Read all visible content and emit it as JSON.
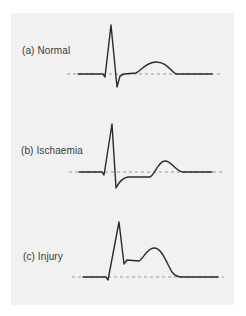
{
  "figure": {
    "background_color": "#f1f1f1",
    "trace_color": "#2a2a2a",
    "baseline_color": "#9a9a9a",
    "panels": [
      {
        "id": "a",
        "label": "(a) Normal",
        "label_pos": {
          "x": 22,
          "y": 45
        },
        "baseline": {
          "x1": 67,
          "x2": 220,
          "y": 74
        },
        "trace_path": "M78,74 L103,74 L105,77 L111,25 L117,87 L120,76 L124,74 L136,73 C142,70 146,62 156,62 C166,62 170,70 176,74 L212,74"
      },
      {
        "id": "b",
        "label": "(b) Ischaemia",
        "label_pos": {
          "x": 21,
          "y": 145
        },
        "baseline": {
          "x1": 69,
          "x2": 222,
          "y": 172
        },
        "trace_path": "M79,172 L102,172 L104,175 L112,124 L116,188 C119,182 122,178 128,177 L150,177 C155,175 158,161 165,161 C172,161 176,172 183,172 L212,172"
      },
      {
        "id": "c",
        "label": "(c) Injury",
        "label_pos": {
          "x": 23,
          "y": 251
        },
        "baseline": {
          "x1": 72,
          "x2": 224,
          "y": 277
        },
        "trace_path": "M83,277 L106,277 L108,280 L119,222 L124,264 L127,260 L139,261 C144,258 147,248 154,248 C162,248 166,262 172,272 C175,276 178,277 182,277 L218,277"
      }
    ]
  }
}
